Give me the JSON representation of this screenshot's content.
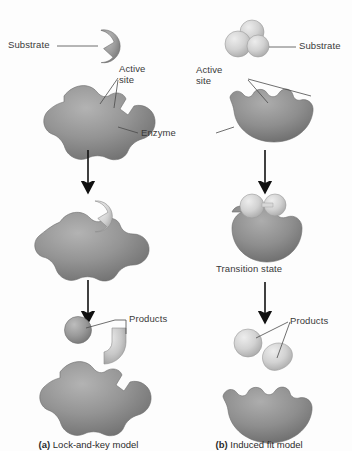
{
  "figure": {
    "background_color": "#fdfdfd",
    "enzyme_color": "#8a8a8a",
    "substrate_color": "#cfcfcf",
    "product_dark_color": "#8e8e8e",
    "leader_color": "#4a4a4a"
  },
  "panels": {
    "left": {
      "caption_marker": "(a)",
      "caption_text": " Lock-and-key model",
      "labels": {
        "substrate": "Substrate",
        "active_site_line1": "Active",
        "active_site_line2": "site",
        "enzyme": "Enzyme",
        "products": "Products"
      }
    },
    "right": {
      "caption_marker": "(b)",
      "caption_text": " Induced fit model",
      "labels": {
        "substrate": "Substrate",
        "active_site_line1": "Active",
        "active_site_line2": "site",
        "transition_state": "Transition state",
        "products": "Products"
      }
    }
  },
  "stages": {
    "row1": "free enzyme and substrate",
    "row2": "enzyme-substrate complex",
    "row3": "enzyme and released products"
  }
}
